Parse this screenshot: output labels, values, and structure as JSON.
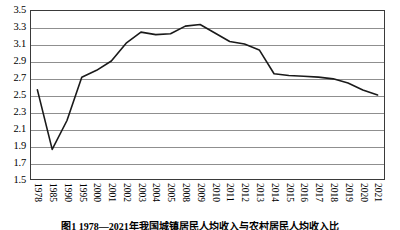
{
  "figure": {
    "caption": "图1  1978—2021年我国城镇居民人均收入与农村居民人均收入比"
  },
  "chart_data": {
    "type": "line",
    "title": "",
    "xlabel": "",
    "ylabel": "",
    "ylim": [
      1.5,
      3.5
    ],
    "ytick_step": 0.2,
    "yticks": [
      "3.5",
      "3.3",
      "3.1",
      "2.9",
      "2.7",
      "2.5",
      "2.3",
      "2.1",
      "1.9",
      "1.7",
      "1.5"
    ],
    "grid": true,
    "legend": "none",
    "line_color": "#1a1a1a",
    "grid_color": "#8f8f8f",
    "categories": [
      "1978",
      "1985",
      "1990",
      "1995",
      "2000",
      "2001",
      "2002",
      "2003",
      "2004",
      "2005",
      "2008",
      "2009",
      "2010",
      "2011",
      "2012",
      "2013",
      "2014",
      "2015",
      "2016",
      "2017",
      "2018",
      "2019",
      "2020",
      "2021"
    ],
    "values": [
      2.56,
      1.86,
      2.2,
      2.71,
      2.79,
      2.9,
      3.11,
      3.24,
      3.21,
      3.22,
      3.31,
      3.33,
      3.23,
      3.13,
      3.1,
      3.03,
      2.75,
      2.73,
      2.72,
      2.71,
      2.69,
      2.64,
      2.56,
      2.5
    ],
    "series": [
      {
        "name": "城乡居民人均收入比",
        "values": [
          2.56,
          1.86,
          2.2,
          2.71,
          2.79,
          2.9,
          3.11,
          3.24,
          3.21,
          3.22,
          3.31,
          3.33,
          3.23,
          3.13,
          3.1,
          3.03,
          2.75,
          2.73,
          2.72,
          2.71,
          2.69,
          2.64,
          2.56,
          2.5
        ]
      }
    ]
  }
}
